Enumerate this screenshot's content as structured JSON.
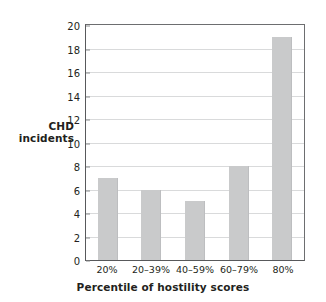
{
  "chart_data": {
    "type": "bar",
    "title": "",
    "categories": [
      "20%",
      "20–39%",
      "40–59%",
      "60–79%",
      "80%"
    ],
    "values": [
      7,
      6,
      5,
      8,
      19
    ],
    "xlabel": "Percentile of hostility scores",
    "ylabel": "CHD incidents",
    "ylabel_lines": [
      "CHD",
      "incidents"
    ],
    "ylim": [
      0,
      20
    ],
    "ytick_step": 2,
    "yticks": [
      0,
      2,
      4,
      6,
      8,
      10,
      12,
      14,
      16,
      18,
      20
    ],
    "ytick_labels": [
      "0",
      "2",
      "4",
      "6",
      "8",
      "10",
      "12",
      "14",
      "16",
      "18",
      "20"
    ],
    "grid": "horizontal",
    "legend": "none",
    "bar_color": "#c9cacb",
    "axis_color": "#58595b",
    "grid_color": "#d9dadb",
    "text_color": "#231f20",
    "background": "#ffffff"
  }
}
